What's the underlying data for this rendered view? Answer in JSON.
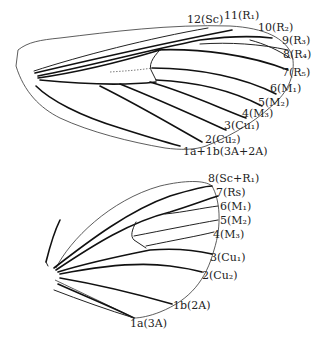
{
  "forewing": {
    "labels": [
      {
        "id": "12",
        "text": "12(Sc)",
        "x": 187,
        "y": 14
      },
      {
        "id": "11",
        "text": "11(R₁)",
        "x": 224,
        "y": 12
      },
      {
        "id": "10",
        "text": "10(R₂)",
        "x": 258,
        "y": 22
      },
      {
        "id": "9",
        "text": "9(R₃)",
        "x": 282,
        "y": 35
      },
      {
        "id": "8",
        "text": "8(R₄)",
        "x": 283,
        "y": 49
      },
      {
        "id": "7",
        "text": "7(R₅)",
        "x": 282,
        "y": 67
      },
      {
        "id": "6",
        "text": "6(M₁)",
        "x": 270,
        "y": 83
      },
      {
        "id": "5",
        "text": "5(M₂)",
        "x": 258,
        "y": 97
      },
      {
        "id": "4",
        "text": "4(M₃)",
        "x": 242,
        "y": 108
      },
      {
        "id": "3",
        "text": "3(Cu₁)",
        "x": 224,
        "y": 120
      },
      {
        "id": "2",
        "text": "2(Cu₂)",
        "x": 205,
        "y": 134
      },
      {
        "id": "1ab",
        "text": "1a+1b(3A+2A)",
        "x": 183,
        "y": 146
      }
    ]
  },
  "hindwing": {
    "labels": [
      {
        "id": "8",
        "text": "8(Sc+R₁)",
        "x": 208,
        "y": 173
      },
      {
        "id": "7",
        "text": "7(Rs)",
        "x": 216,
        "y": 187
      },
      {
        "id": "6",
        "text": "6(M₁)",
        "x": 220,
        "y": 201
      },
      {
        "id": "5",
        "text": "5(M₂)",
        "x": 220,
        "y": 215
      },
      {
        "id": "4",
        "text": "4(M₃)",
        "x": 213,
        "y": 229
      },
      {
        "id": "3",
        "text": "3(Cu₁)",
        "x": 210,
        "y": 252
      },
      {
        "id": "2",
        "text": "2(Cu₂)",
        "x": 202,
        "y": 270
      },
      {
        "id": "1b",
        "text": "1b(2A)",
        "x": 173,
        "y": 300
      },
      {
        "id": "1a",
        "text": "1a(3A)",
        "x": 130,
        "y": 318
      }
    ]
  }
}
